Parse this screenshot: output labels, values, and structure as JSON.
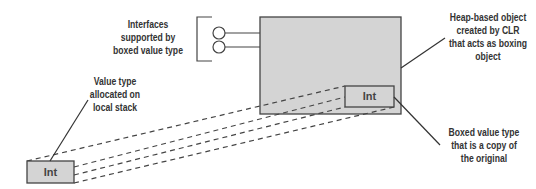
{
  "diagram": {
    "labels": {
      "interfaces": "Interfaces supported by boxed value type",
      "heap_object": "Heap-based object created by CLR that acts as boxing object",
      "value_type": "Value type allocated on local stack",
      "boxed_copy": "Boxed value type that is a copy of the original"
    },
    "boxes": {
      "stack_int": "Int",
      "boxed_int": "Int"
    },
    "colors": {
      "box_fill": "#d4d4d4",
      "stroke": "#444444"
    }
  }
}
